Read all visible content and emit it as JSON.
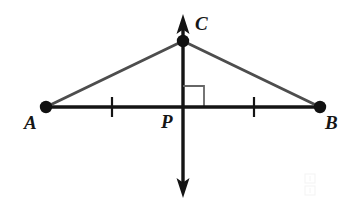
{
  "figure": {
    "background_color": "#ffffff"
  },
  "labels": {
    "a": "A",
    "b": "B",
    "c": "C",
    "p": "P"
  },
  "points": {
    "A": {
      "name": "A",
      "x": 46,
      "y": 107
    },
    "B": {
      "name": "B",
      "x": 320,
      "y": 107
    },
    "C": {
      "name": "C",
      "x": 183,
      "y": 41
    },
    "P": {
      "name": "P",
      "x": 183,
      "y": 107
    }
  },
  "segments": [
    {
      "name": "segment-AB",
      "from": "A",
      "to": "B",
      "color": "#141414",
      "width": 3.4,
      "style": "solid"
    },
    {
      "name": "segment-AC",
      "from": "A",
      "to": "C",
      "color": "#4d4d4d",
      "width": 3.0,
      "style": "solid"
    },
    {
      "name": "segment-CB",
      "from": "C",
      "to": "B",
      "color": "#4d4d4d",
      "width": 3.0,
      "style": "solid"
    }
  ],
  "vertical_line": {
    "name": "perpendicular-bisector-line",
    "x": 183,
    "y_top": 16,
    "y_bottom": 196,
    "color": "#141414",
    "width": 3.4,
    "arrow_top": true,
    "arrow_bottom": true
  },
  "tick_marks": [
    {
      "name": "tick-mark-AP",
      "x": 112,
      "y": 107,
      "half_height": 10,
      "color": "#141414",
      "width": 2.2
    },
    {
      "name": "tick-mark-PB",
      "x": 254,
      "y": 107,
      "half_height": 10,
      "color": "#141414",
      "width": 2.2
    }
  ],
  "right_angle": {
    "name": "right-angle-marker",
    "x": 183,
    "y": 107,
    "size": 21,
    "direction": "upper-right",
    "color": "#666666",
    "width": 1.8
  },
  "vertex_dots": {
    "radius": 6.2,
    "color": "#111111"
  },
  "colors": {
    "stroke_black": "#141414",
    "stroke_gray": "#4d4d4d",
    "marker_gray": "#666666",
    "label_text": "#161616",
    "background": "#ffffff"
  }
}
